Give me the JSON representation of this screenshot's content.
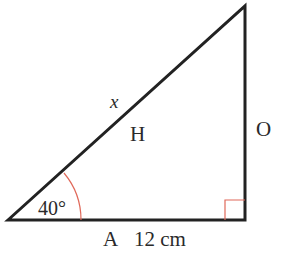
{
  "diagram": {
    "type": "right-triangle",
    "vertices": {
      "acute_angle_vertex": [
        8,
        220
      ],
      "top_vertex": [
        245,
        6
      ],
      "right_angle_vertex": [
        245,
        220
      ]
    },
    "angle": {
      "label": "40°",
      "value_deg": 40,
      "arc_color": "#e0695a"
    },
    "right_angle_marker_color": "#e0695a",
    "line_color": "#222222",
    "labels": {
      "hypotenuse_var": "x",
      "hypotenuse": "H",
      "opposite": "O",
      "adjacent": "A",
      "adjacent_length": "12 cm"
    }
  }
}
